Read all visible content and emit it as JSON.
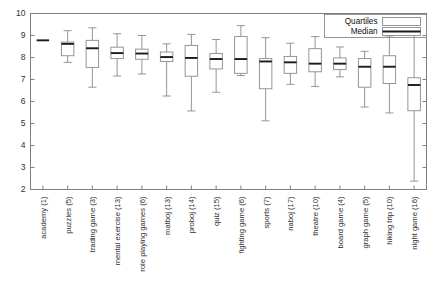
{
  "chart_data": {
    "type": "box",
    "title": "",
    "xlabel": "",
    "ylabel": "",
    "ylim": [
      2,
      10
    ],
    "yticks": [
      2,
      3,
      4,
      5,
      6,
      7,
      8,
      9,
      10
    ],
    "grid": false,
    "legend_position": "top-right",
    "legend": [
      {
        "key": "quartiles",
        "label": "Quartiles"
      },
      {
        "key": "median",
        "label": "Median"
      }
    ],
    "categories": [
      "academy (1)",
      "puzzles (5)",
      "trading game (3)",
      "mental exercise (13)",
      "role playing games (6)",
      "matboj (13)",
      "proboj (14)",
      "quiz (15)",
      "fighting game (6)",
      "sports (7)",
      "naboj (17)",
      "theatre (10)",
      "board game (4)",
      "graph game (5)",
      "hiking trip (10)",
      "night game (16)"
    ],
    "boxes": [
      {
        "category": "academy (1)",
        "n": 1,
        "whisker_low": 8.78,
        "q1": 8.78,
        "median": 8.78,
        "q3": 8.78,
        "whisker_high": 8.78
      },
      {
        "category": "puzzles (5)",
        "n": 5,
        "whisker_low": 7.78,
        "q1": 8.08,
        "median": 8.62,
        "q3": 8.7,
        "whisker_high": 9.22
      },
      {
        "category": "trading game (3)",
        "n": 3,
        "whisker_low": 6.65,
        "q1": 7.55,
        "median": 8.42,
        "q3": 8.78,
        "whisker_high": 9.35
      },
      {
        "category": "mental exercise (13)",
        "n": 13,
        "whisker_low": 7.16,
        "q1": 7.95,
        "median": 8.2,
        "q3": 8.47,
        "whisker_high": 9.08
      },
      {
        "category": "role playing games (6)",
        "n": 6,
        "whisker_low": 7.25,
        "q1": 7.92,
        "median": 8.18,
        "q3": 8.38,
        "whisker_high": 9.0
      },
      {
        "category": "matboj (13)",
        "n": 13,
        "whisker_low": 6.25,
        "q1": 7.82,
        "median": 8.02,
        "q3": 8.25,
        "whisker_high": 8.62
      },
      {
        "category": "proboj (14)",
        "n": 14,
        "whisker_low": 5.57,
        "q1": 7.15,
        "median": 7.98,
        "q3": 8.55,
        "whisker_high": 9.05
      },
      {
        "category": "quiz (15)",
        "n": 15,
        "whisker_low": 6.42,
        "q1": 7.48,
        "median": 7.93,
        "q3": 8.18,
        "whisker_high": 8.82
      },
      {
        "category": "fighting game (6)",
        "n": 6,
        "whisker_low": 7.18,
        "q1": 7.28,
        "median": 7.93,
        "q3": 8.95,
        "whisker_high": 9.45
      },
      {
        "category": "sports (7)",
        "n": 7,
        "whisker_low": 5.12,
        "q1": 6.58,
        "median": 7.82,
        "q3": 7.95,
        "whisker_high": 8.9
      },
      {
        "category": "naboj (17)",
        "n": 17,
        "whisker_low": 6.78,
        "q1": 7.28,
        "median": 7.78,
        "q3": 8.05,
        "whisker_high": 8.65
      },
      {
        "category": "theatre (10)",
        "n": 10,
        "whisker_low": 6.68,
        "q1": 7.35,
        "median": 7.72,
        "q3": 8.4,
        "whisker_high": 8.95
      },
      {
        "category": "board game (4)",
        "n": 4,
        "whisker_low": 7.12,
        "q1": 7.45,
        "median": 7.72,
        "q3": 7.98,
        "whisker_high": 8.48
      },
      {
        "category": "graph game (5)",
        "n": 5,
        "whisker_low": 5.75,
        "q1": 6.65,
        "median": 7.58,
        "q3": 7.95,
        "whisker_high": 8.28
      },
      {
        "category": "hiking trip (10)",
        "n": 10,
        "whisker_low": 5.48,
        "q1": 6.82,
        "median": 7.58,
        "q3": 8.08,
        "whisker_high": 8.98
      },
      {
        "category": "night game (16)",
        "n": 16,
        "whisker_low": 2.38,
        "q1": 5.58,
        "median": 6.75,
        "q3": 7.08,
        "whisker_high": 9.22
      }
    ]
  }
}
